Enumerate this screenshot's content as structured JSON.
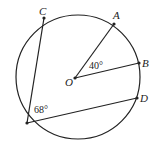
{
  "diagram": {
    "type": "circle-geometry",
    "circle": {
      "cx": 78,
      "cy": 77,
      "r": 62,
      "stroke": "#222222"
    },
    "points": {
      "C": {
        "label": "C",
        "x": 44,
        "y": 18
      },
      "A": {
        "label": "A",
        "x": 114,
        "y": 24
      },
      "B": {
        "label": "B",
        "x": 139,
        "y": 63
      },
      "D": {
        "label": "D",
        "x": 137,
        "y": 98
      },
      "O": {
        "label": "O",
        "x": 75,
        "y": 78
      },
      "E": {
        "label": "",
        "x": 27,
        "y": 123
      }
    },
    "segments": [
      {
        "from": "O",
        "to": "A"
      },
      {
        "from": "O",
        "to": "B"
      },
      {
        "from": "E",
        "to": "C"
      },
      {
        "from": "E",
        "to": "D"
      }
    ],
    "angles": {
      "AOB": {
        "text": "40°"
      },
      "CED": {
        "text": "68°"
      }
    }
  }
}
